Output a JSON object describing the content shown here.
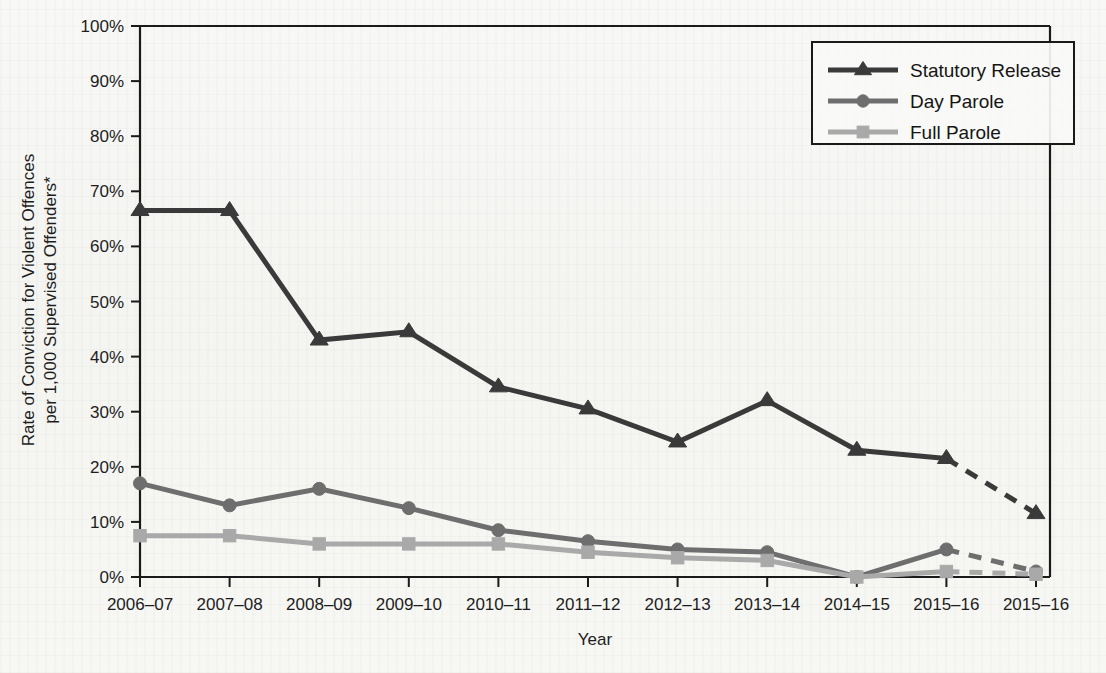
{
  "figure": {
    "background_color": "#f7f7f5",
    "axis_color": "#1a1a1a"
  },
  "axes": {
    "y_axis_title_line1": "Rate of Conviction for Violent Offences",
    "y_axis_title_line2": "per 1,000 Supervised Offenders*",
    "x_axis_title": "Year",
    "y_tick_labels": [
      "0%",
      "10%",
      "20%",
      "30%",
      "40%",
      "50%",
      "60%",
      "70%",
      "80%",
      "90%",
      "100%"
    ],
    "x_tick_labels": [
      "2006–07",
      "2007–08",
      "2008–09",
      "2009–10",
      "2010–11",
      "2011–12",
      "2012–13",
      "2013–14",
      "2014–15",
      "2015–16",
      "2015–16"
    ]
  },
  "legend": {
    "position": "top-right",
    "entries": [
      {
        "label": "Statutory Release",
        "color": "#3a3a3a",
        "marker": "triangle"
      },
      {
        "label": "Day Parole",
        "color": "#6e6e6e",
        "marker": "circle"
      },
      {
        "label": "Full Parole",
        "color": "#a9a9a9",
        "marker": "square"
      }
    ]
  },
  "chart_data": {
    "type": "line",
    "title": "",
    "xlabel": "Year",
    "ylabel": "Rate of Conviction for Violent Offences per 1,000 Supervised Offenders*",
    "ylim": [
      0,
      100
    ],
    "y_unit": "%",
    "grid": false,
    "legend_position": "top-right",
    "categories": [
      "2006–07",
      "2007–08",
      "2008–09",
      "2009–10",
      "2010–11",
      "2011–12",
      "2012–13",
      "2013–14",
      "2014–15",
      "2015–16",
      "2015–16"
    ],
    "series": [
      {
        "name": "Statutory Release",
        "color": "#3a3a3a",
        "marker": "triangle",
        "values": [
          66.5,
          66.5,
          43.0,
          44.5,
          34.5,
          30.5,
          24.5,
          32.0,
          23.0,
          21.5,
          11.5
        ],
        "dashed_from_index": 9
      },
      {
        "name": "Day Parole",
        "color": "#6e6e6e",
        "marker": "circle",
        "values": [
          17.0,
          13.0,
          16.0,
          12.5,
          8.5,
          6.5,
          5.0,
          4.5,
          0.0,
          5.0,
          1.0
        ],
        "dashed_from_index": 9
      },
      {
        "name": "Full Parole",
        "color": "#a9a9a9",
        "marker": "square",
        "values": [
          7.5,
          7.5,
          6.0,
          6.0,
          6.0,
          4.5,
          3.5,
          3.0,
          0.0,
          1.0,
          0.5
        ],
        "dashed_from_index": 9
      }
    ]
  }
}
